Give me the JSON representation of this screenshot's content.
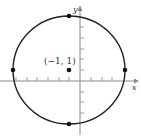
{
  "diagram": {
    "type": "circle-on-coordinate-plane",
    "axes": {
      "x_label": "x",
      "y_label": "y",
      "x_ticks": [
        -6,
        -5,
        -4,
        -3,
        -2,
        -1,
        1,
        2,
        3,
        4
      ],
      "y_ticks": [
        -4,
        -3,
        -2,
        -1,
        1,
        2,
        3,
        4,
        5,
        6
      ]
    },
    "circle": {
      "center": [
        -1,
        1
      ],
      "radius": 5
    },
    "center_label": "(−1, 1)",
    "points": [
      {
        "name": "center",
        "x": -1,
        "y": 1
      },
      {
        "name": "left",
        "x": -6,
        "y": 1
      },
      {
        "name": "right",
        "x": 4,
        "y": 1
      },
      {
        "name": "top",
        "x": -1,
        "y": 6
      },
      {
        "name": "bottom",
        "x": -1,
        "y": -4
      }
    ],
    "colors": {
      "curve": "#222222",
      "axis": "#888888",
      "points": "#111111"
    }
  }
}
